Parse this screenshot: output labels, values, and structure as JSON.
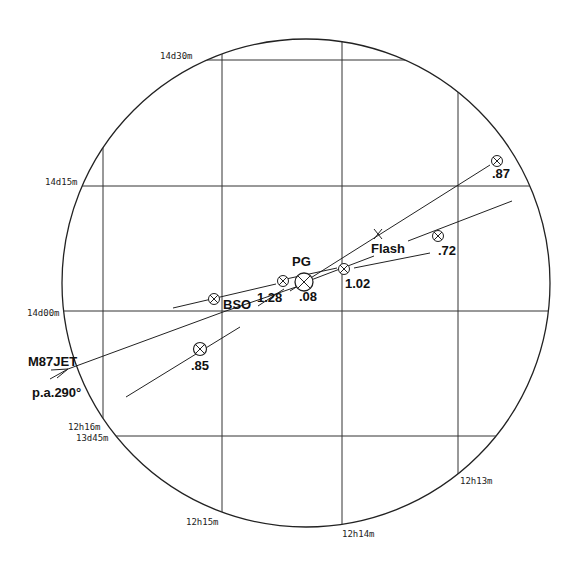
{
  "diagram": {
    "type": "sky-finder-chart",
    "circle": {
      "cx": 306,
      "cy": 283,
      "r": 244
    },
    "grid": {
      "ra_labels": [
        {
          "text": "12h16m",
          "x": 103
        },
        {
          "text": "12h15m",
          "x": 222
        },
        {
          "text": "12h14m",
          "x": 342
        },
        {
          "text": "12h13m",
          "x": 458
        }
      ],
      "dec_labels": [
        {
          "text": "14d30m",
          "y": 60
        },
        {
          "text": "14d15m",
          "y": 186
        },
        {
          "text": "14d00m",
          "y": 311
        },
        {
          "text": "13d45m",
          "y": 436
        }
      ]
    },
    "objects": [
      {
        "id": "PG",
        "label": "PG",
        "value": ".08",
        "x": 304,
        "y": 282,
        "size": "large"
      },
      {
        "id": "p128",
        "label": "",
        "value": "1.28",
        "x": 283,
        "y": 281
      },
      {
        "id": "BSO",
        "label": "BSO",
        "value": "",
        "x": 214,
        "y": 299
      },
      {
        "id": "p102",
        "label": "",
        "value": "1.02",
        "x": 344,
        "y": 269
      },
      {
        "id": "p072",
        "label": "",
        "value": ".72",
        "x": 438,
        "y": 236
      },
      {
        "id": "p087",
        "label": "",
        "value": ".87",
        "x": 497,
        "y": 161
      },
      {
        "id": "p085",
        "label": "",
        "value": ".85",
        "x": 200,
        "y": 349
      }
    ],
    "flash": {
      "label": "Flash",
      "x": 378,
      "y": 234
    },
    "jet": {
      "label": "M87JET",
      "pa_label": "p.a.290°"
    }
  }
}
